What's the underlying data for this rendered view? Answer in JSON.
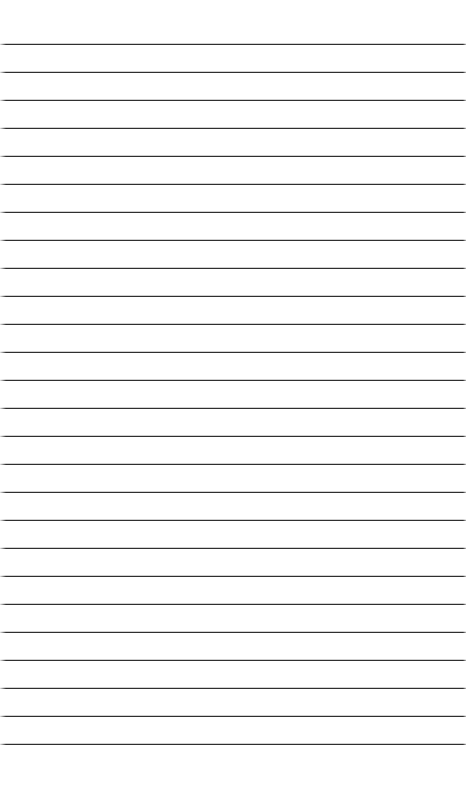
{
  "page": {
    "kind": "lined-paper-sheet",
    "width": 470,
    "height": 803,
    "background_color": "#ffffff",
    "content_text": ""
  },
  "ruling": {
    "style": "horizontal-ruled",
    "line_count": 26,
    "first_line_y": 43,
    "line_spacing": 28,
    "line_left_x": 0,
    "line_right_x": 466,
    "line_width": 466,
    "line_thickness": 1,
    "rule_color": "#2f2f2f",
    "halo_color": "#cfcfcf",
    "lines_y": [
      43,
      71,
      99,
      127,
      155,
      183,
      211,
      239,
      267,
      295,
      295,
      323,
      351,
      379,
      407,
      435,
      463,
      491,
      519,
      547,
      575,
      603,
      631,
      659,
      687,
      715,
      743
    ]
  },
  "regions": {
    "top_margin": {
      "y": 0,
      "height": 43,
      "label": "top margin"
    },
    "ruled_body": {
      "y": 43,
      "height": 701,
      "label": "ruled writing area"
    },
    "bottom_margin": {
      "y": 744,
      "height": 59,
      "label": "bottom margin"
    }
  }
}
